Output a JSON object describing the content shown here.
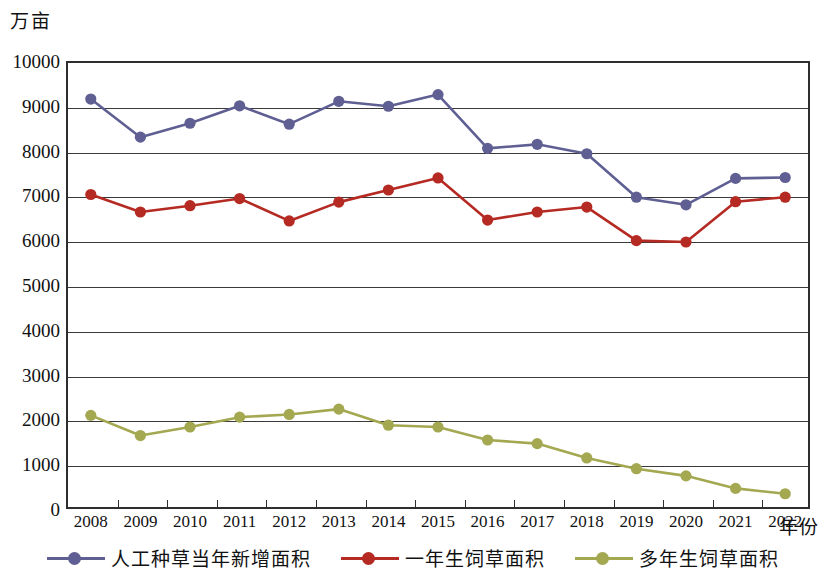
{
  "chart_data": {
    "type": "line",
    "title": "",
    "xlabel": "年份",
    "ylabel": "万亩",
    "x": [
      2008,
      2009,
      2010,
      2011,
      2012,
      2013,
      2014,
      2015,
      2016,
      2017,
      2018,
      2019,
      2020,
      2021,
      2022
    ],
    "categories": [
      "2008",
      "2009",
      "2010",
      "2011",
      "2012",
      "2013",
      "2014",
      "2015",
      "2016",
      "2017",
      "2018",
      "2019",
      "2020",
      "2021",
      "2022"
    ],
    "xlim": [
      2008,
      2022
    ],
    "ylim": [
      0,
      10000
    ],
    "yticks": [
      0,
      1000,
      2000,
      3000,
      4000,
      5000,
      6000,
      7000,
      8000,
      9000,
      10000
    ],
    "ytick_labels": [
      "0",
      "1000",
      "2000",
      "3000",
      "4000",
      "5000",
      "6000",
      "7000",
      "8000",
      "9000",
      "10000"
    ],
    "grid": "horizontal",
    "legend_position": "bottom",
    "series": [
      {
        "name": "人工种草当年新增面积",
        "color": "#5f5f93",
        "marker": "circle",
        "values": [
          9150,
          8300,
          8610,
          9000,
          8590,
          9100,
          8990,
          9250,
          8050,
          8140,
          7930,
          6960,
          6790,
          7380,
          7400
        ]
      },
      {
        "name": "一年生饲草面积",
        "color": "#b52a22",
        "marker": "circle",
        "values": [
          7020,
          6630,
          6770,
          6930,
          6430,
          6850,
          7120,
          7390,
          6450,
          6630,
          6740,
          5990,
          5960,
          6860,
          6960
        ]
      },
      {
        "name": "多年生饲草面积",
        "color": "#a3a851",
        "marker": "circle",
        "values": [
          2090,
          1640,
          1830,
          2050,
          2110,
          2230,
          1870,
          1830,
          1540,
          1460,
          1140,
          900,
          740,
          460,
          340
        ]
      }
    ]
  },
  "axes": {
    "y_unit_label": "万亩",
    "x_unit_label": "年份"
  }
}
